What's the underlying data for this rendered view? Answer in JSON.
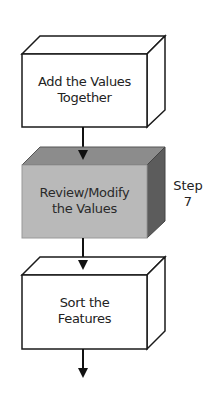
{
  "diagram": {
    "type": "flowchart",
    "boxes": [
      {
        "id": "box1",
        "line1": "Add the Values",
        "line2": "Together",
        "highlighted": false
      },
      {
        "id": "box2",
        "line1": "Review/Modify",
        "line2": "the Values",
        "highlighted": true
      },
      {
        "id": "box3",
        "line1": "Sort the",
        "line2": "Features",
        "highlighted": false
      }
    ],
    "step_label": {
      "word": "Step",
      "number": "7"
    },
    "colors": {
      "outline": "#1a1a1a",
      "plain_fill": "#ffffff",
      "highlight_front": "#b9b9b9",
      "highlight_top": "#8c8c8c",
      "highlight_side": "#5c5c5c"
    }
  }
}
